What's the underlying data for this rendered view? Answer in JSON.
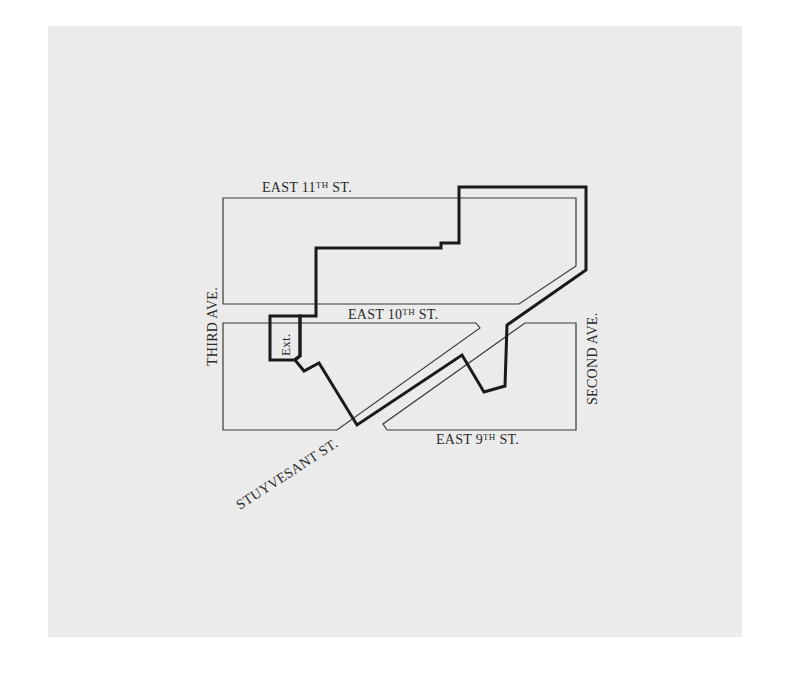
{
  "map": {
    "background": "#ebebeb",
    "line_color": "#3a3a3a",
    "boundary_color": "#1a1a1a",
    "labels": {
      "east_11th": {
        "pre": "EAST 11",
        "sup": "TH",
        "post": " ST."
      },
      "east_10th": {
        "pre": "EAST 10",
        "sup": "TH",
        "post": " ST."
      },
      "east_9th": {
        "pre": "EAST 9",
        "sup": "TH",
        "post": " ST."
      },
      "third_ave": "THIRD AVE.",
      "second_ave": "SECOND AVE.",
      "stuyvesant": "STUYVESANT ST.",
      "ext": "Ext."
    },
    "blocks": [
      {
        "name": "block-north",
        "points": "223,198 576,198 576,266 519,304 223,304"
      },
      {
        "name": "block-southwest",
        "points": "223,323 476,323 480,328 337,430 223,430"
      },
      {
        "name": "block-southeast",
        "points": "525,323 576,323 576,430 387,430 383,424"
      }
    ],
    "boundary": {
      "main": "316,305 316,248 441,248 441,243 459,243 459,187 586,187 586,270 507,325 505,386 484,392 462,355 357,425 319,363 304,371 295,360 300,356 300,316 316,316 316,305",
      "extension": "270,316 300,316 300,356 294,360 270,360"
    }
  }
}
